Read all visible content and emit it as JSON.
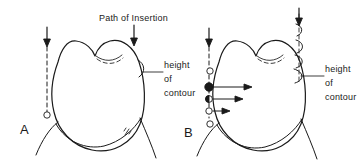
{
  "figure": {
    "title": "Path of Insertion",
    "background_color": "#ffffff",
    "ink_color": "#1a1a1a",
    "width": 360,
    "height": 166
  },
  "panels": [
    {
      "id": "A",
      "label": "A",
      "height_of_contour_label": {
        "line1": "height",
        "line2": "of",
        "line3": "contour"
      },
      "arrows": [
        {
          "name": "path-of-insertion-arrow-left",
          "direction": "down"
        },
        {
          "name": "path-of-insertion-arrow-right",
          "direction": "down"
        }
      ],
      "markers": [
        {
          "name": "clasp-terminal-marker",
          "style": "open"
        }
      ],
      "survey_line_style": "dashed"
    },
    {
      "id": "B",
      "label": "B",
      "height_of_contour_label": {
        "line1": "height",
        "line2": "of",
        "line3": "contour"
      },
      "arrows": [
        {
          "name": "path-of-insertion-arrow-left",
          "direction": "down"
        },
        {
          "name": "path-of-insertion-arrow-right",
          "direction": "down"
        },
        {
          "name": "undercut-arrow-1",
          "direction": "right",
          "length": "long"
        },
        {
          "name": "undercut-arrow-2",
          "direction": "right",
          "length": "medium"
        },
        {
          "name": "undercut-arrow-3",
          "direction": "right",
          "length": "short"
        }
      ],
      "markers": [
        {
          "name": "clasp-marker-1",
          "style": "open"
        },
        {
          "name": "clasp-marker-2",
          "style": "filled"
        },
        {
          "name": "clasp-marker-3",
          "style": "half-filled"
        },
        {
          "name": "clasp-marker-4",
          "style": "open"
        },
        {
          "name": "clasp-marker-5",
          "style": "open"
        }
      ],
      "contour_gauge_shapes": [
        {
          "name": "undercut-gauge-d-1"
        },
        {
          "name": "undercut-gauge-d-2"
        },
        {
          "name": "undercut-gauge-d-3"
        },
        {
          "name": "undercut-gauge-d-4"
        }
      ],
      "survey_line_style": "dashed"
    }
  ]
}
